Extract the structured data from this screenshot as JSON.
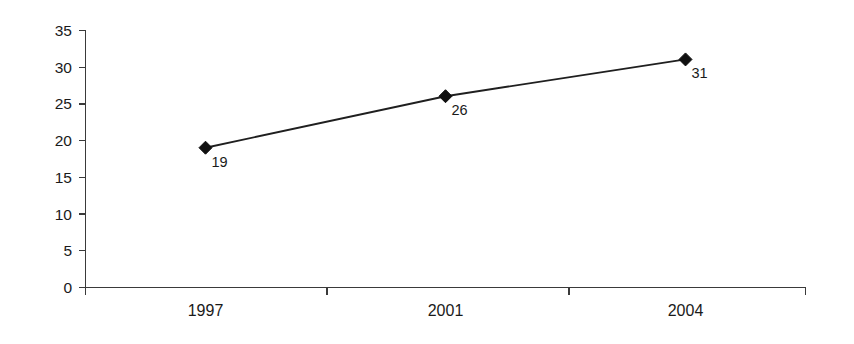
{
  "chart_data": {
    "type": "line",
    "title": "",
    "subtitle": "",
    "xlabel": "",
    "ylabel": "",
    "categories": [
      "1997",
      "2001",
      "2004"
    ],
    "values": [
      19,
      26,
      31
    ],
    "point_labels": [
      "19",
      "26",
      "31"
    ],
    "series": [
      {
        "name": "",
        "values": [
          19,
          26,
          31
        ],
        "marker": "diamond",
        "color": "#101010"
      }
    ],
    "ylim": [
      0,
      35
    ],
    "ytick_labels": [
      "0",
      "5",
      "10",
      "15",
      "20",
      "25",
      "30",
      "35"
    ],
    "ytick_values": [
      0,
      5,
      10,
      15,
      20,
      25,
      30,
      35
    ],
    "xtick_labels": [
      "1997",
      "2001",
      "2004"
    ],
    "grid": false,
    "legend": false,
    "legend_position": "none",
    "background_color": "#ffffff",
    "axis_color": "#3a3a3a",
    "line_color": "#1f1f1f",
    "marker_color": "#101010"
  },
  "axis": {
    "y": {
      "t0": "0",
      "t5": "5",
      "t10": "10",
      "t15": "15",
      "t20": "20",
      "t25": "25",
      "t30": "30",
      "t35": "35"
    },
    "x": {
      "c0": "1997",
      "c1": "2001",
      "c2": "2004"
    }
  },
  "labels": {
    "p0": "19",
    "p1": "26",
    "p2": "31"
  }
}
